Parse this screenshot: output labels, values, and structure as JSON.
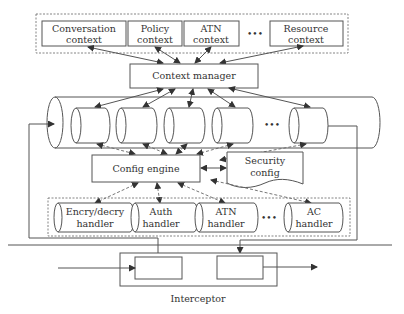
{
  "contexts": {
    "items": [
      {
        "line1": "Conversation",
        "line2": "context"
      },
      {
        "line1": "Policy",
        "line2": "context"
      },
      {
        "line1": "ATN",
        "line2": "context"
      },
      {
        "line1": "Resource",
        "line2": "context"
      }
    ],
    "ellipsis": "•••"
  },
  "context_manager": {
    "label": "Context manager"
  },
  "pipeline": {
    "ellipsis": "•••"
  },
  "config_engine": {
    "label": "Config engine"
  },
  "security_config": {
    "line1": "Security",
    "line2": "config"
  },
  "handlers": {
    "items": [
      {
        "line1": "Encry/decry",
        "line2": "handler"
      },
      {
        "line1": "Auth",
        "line2": "handler"
      },
      {
        "line1": "ATN",
        "line2": "handler"
      },
      {
        "line1": "AC",
        "line2": "handler"
      }
    ],
    "ellipsis": "•••"
  },
  "interceptor": {
    "label": "Interceptor"
  },
  "colors": {
    "stroke": "#555555",
    "text": "#333333",
    "background": "#ffffff"
  }
}
